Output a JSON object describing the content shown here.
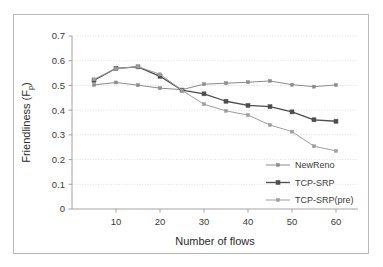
{
  "chart_data": {
    "type": "line",
    "title": "",
    "xlabel": "Number of flows",
    "ylabel": "Friendliness (F",
    "ylabel_sub": "p",
    "ylabel_close": ")",
    "x": [
      5,
      10,
      15,
      20,
      25,
      30,
      35,
      40,
      45,
      50,
      55,
      60
    ],
    "xlim": [
      0,
      65
    ],
    "ylim": [
      0,
      0.7
    ],
    "xticks": [
      10,
      20,
      30,
      40,
      50,
      60
    ],
    "xtick_labels": [
      "10",
      "20",
      "30",
      "40",
      "50",
      "60"
    ],
    "yticks": [
      0,
      0.1,
      0.2,
      0.3,
      0.4,
      0.5,
      0.6,
      0.7
    ],
    "ytick_labels": [
      "0",
      "0.1",
      "0.2",
      "0.3",
      "0.4",
      "0.5",
      "0.6",
      "0.7"
    ],
    "grid": true,
    "legend_position": "lower-right",
    "series": [
      {
        "name": "NewReno",
        "color": "#8c8c8c",
        "marker": "square-small",
        "values": [
          0.502,
          0.512,
          0.501,
          0.489,
          0.483,
          0.505,
          0.509,
          0.513,
          0.518,
          0.503,
          0.495,
          0.502
        ]
      },
      {
        "name": "TCP-SRP",
        "color": "#4d4d4d",
        "marker": "square-large",
        "values": [
          0.521,
          0.569,
          0.575,
          0.537,
          0.481,
          0.466,
          0.436,
          0.419,
          0.414,
          0.393,
          0.361,
          0.355
        ]
      },
      {
        "name": "TCP-SRP(pre)",
        "color": "#9e9e9e",
        "marker": "square-small",
        "values": [
          0.525,
          0.568,
          0.576,
          0.545,
          0.48,
          0.424,
          0.397,
          0.38,
          0.34,
          0.313,
          0.254,
          0.235
        ]
      }
    ]
  }
}
